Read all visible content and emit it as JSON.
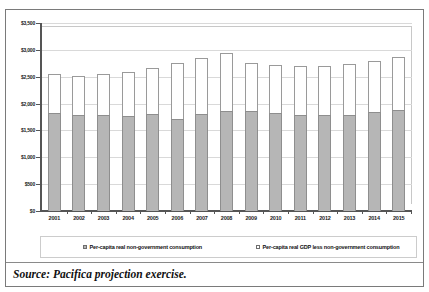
{
  "figure": {
    "source_note": "Source: Pacifica projection exercise.",
    "title_cutoff": ""
  },
  "chart_data": {
    "type": "bar",
    "stacked": true,
    "title": "",
    "xlabel": "",
    "ylabel": "",
    "ylim": [
      0,
      3500
    ],
    "ytick_step": 500,
    "grid": true,
    "legend_position": "bottom",
    "currency_prefix": "$",
    "categories": [
      "2001",
      "2002",
      "2003",
      "2004",
      "2005",
      "2006",
      "2007",
      "2008",
      "2009",
      "2010",
      "2011",
      "2012",
      "2013",
      "2014",
      "2015"
    ],
    "ytick_labels": [
      "$0",
      "$500",
      "$1,000",
      "$1,500",
      "$2,000",
      "$2,500",
      "$3,000",
      "$3,500"
    ],
    "ytick_values": [
      0,
      500,
      1000,
      1500,
      2000,
      2500,
      3000,
      3500
    ],
    "series": [
      {
        "name": "Per-capita real non-government consumption",
        "color": "#b6b6b6",
        "values": [
          1820,
          1790,
          1780,
          1775,
          1800,
          1710,
          1800,
          1860,
          1860,
          1820,
          1790,
          1790,
          1790,
          1840,
          1880
        ]
      },
      {
        "name": "Per-capita real GDP less non-government consumption",
        "color": "#ffffff",
        "values": [
          730,
          730,
          780,
          815,
          860,
          1040,
          1050,
          1090,
          890,
          900,
          910,
          910,
          940,
          950,
          990
        ]
      }
    ],
    "totals": [
      2550,
      2520,
      2560,
      2590,
      2660,
      2750,
      2850,
      2950,
      2750,
      2720,
      2700,
      2700,
      2730,
      2790,
      2870
    ],
    "legend_entries": [
      "Per-capita real non-government consumption",
      "Per-capita real GDP less non-government consumption"
    ]
  }
}
